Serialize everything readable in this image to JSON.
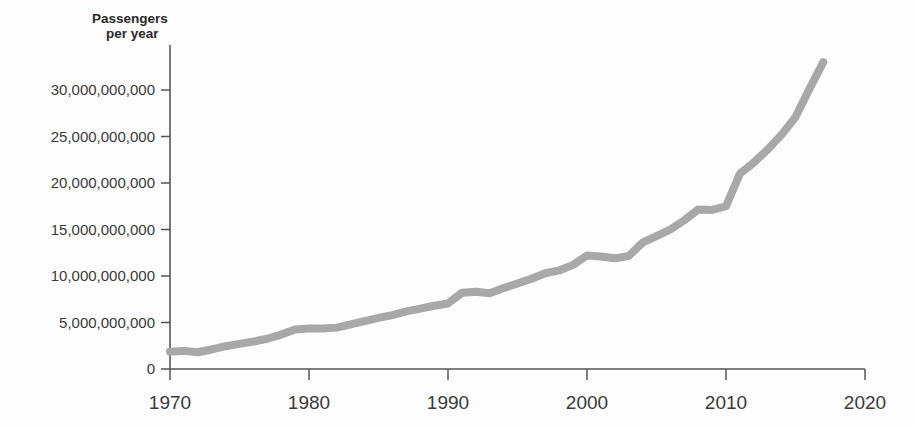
{
  "chart_data": {
    "type": "line",
    "title": "",
    "subtitle": "",
    "ylabel_line1": "Passengers",
    "ylabel_line2": "per year",
    "xlabel": "",
    "xlim": [
      1970,
      2020
    ],
    "ylim": [
      0,
      33500000000
    ],
    "grid": false,
    "legend": "none",
    "series_name": "Passengers per year",
    "line_color": "#a8a8a8",
    "axis_color": "#555555",
    "text_color": "#3a3a3a",
    "background_color": "#fdfdfd",
    "y_ticks": [
      0,
      5000000000,
      10000000000,
      15000000000,
      20000000000,
      25000000000,
      30000000000
    ],
    "y_tick_labels": [
      "0",
      "5,000,000,000",
      "10,000,000,000",
      "15,000,000,000",
      "20,000,000,000",
      "25,000,000,000",
      "30,000,000,000"
    ],
    "x_ticks": [
      1970,
      1980,
      1990,
      2000,
      2010,
      2020
    ],
    "x_tick_labels": [
      "1970",
      "1980",
      "1990",
      "2000",
      "2010",
      "2020"
    ],
    "x": [
      1970,
      1971,
      1972,
      1973,
      1974,
      1975,
      1976,
      1977,
      1978,
      1979,
      1980,
      1981,
      1982,
      1983,
      1984,
      1985,
      1986,
      1987,
      1988,
      1989,
      1990,
      1991,
      1992,
      1993,
      1994,
      1995,
      1996,
      1997,
      1998,
      1999,
      2000,
      2001,
      2002,
      2003,
      2004,
      2005,
      2006,
      2007,
      2008,
      2009,
      2010,
      2011,
      2012,
      2013,
      2014,
      2015,
      2016,
      2017
    ],
    "values": [
      1850000000,
      1950000000,
      1800000000,
      2100000000,
      2450000000,
      2700000000,
      2950000000,
      3250000000,
      3700000000,
      4250000000,
      4350000000,
      4350000000,
      4450000000,
      4800000000,
      5150000000,
      5500000000,
      5800000000,
      6200000000,
      6500000000,
      6800000000,
      7050000000,
      8200000000,
      8300000000,
      8150000000,
      8700000000,
      9200000000,
      9700000000,
      10300000000,
      10600000000,
      11200000000,
      12200000000,
      12100000000,
      11900000000,
      12150000000,
      13600000000,
      14300000000,
      15000000000,
      16000000000,
      17150000000,
      17100000000,
      17500000000,
      21000000000,
      22200000000,
      23600000000,
      25200000000,
      27100000000,
      30100000000,
      33000000000
    ]
  },
  "figure": {
    "plot_left_px": 170,
    "plot_right_px": 865,
    "plot_top_px": 45,
    "baseline_px": 369
  }
}
